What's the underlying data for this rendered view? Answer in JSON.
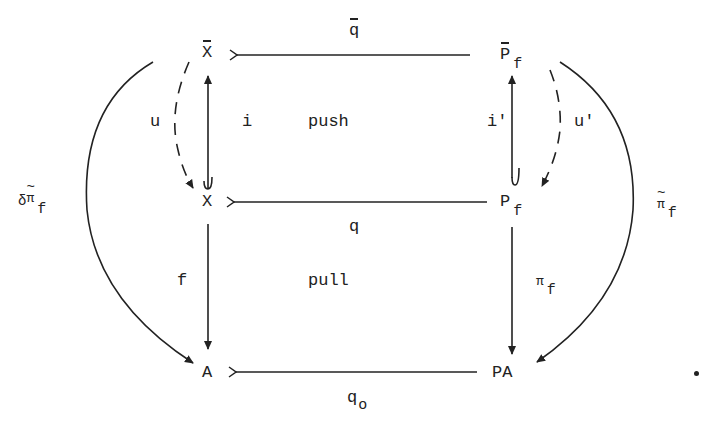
{
  "diagram": {
    "nodes": {
      "x_bar": "X",
      "p_bar_f": {
        "base": "P",
        "sub": "f"
      },
      "x": "X",
      "p_f": {
        "base": "P",
        "sub": "f"
      },
      "a": "A",
      "pa": "PA"
    },
    "arrows": {
      "q_bar": "q",
      "q": "q",
      "q_o": {
        "base": "q",
        "sub": "o"
      },
      "i": "i",
      "i_prime": "i'",
      "u": "u",
      "u_prime": "u'",
      "f": "f",
      "pi_f": {
        "base": "π",
        "sub": "f"
      },
      "pi_tilde_f": {
        "base": "π",
        "sub": "f"
      },
      "delta_pi_tilde_f": {
        "prefix": "δ",
        "base": "π",
        "sub": "f"
      }
    },
    "regions": {
      "push": "push",
      "pull": "pull"
    },
    "top_fragment": "\""
  }
}
